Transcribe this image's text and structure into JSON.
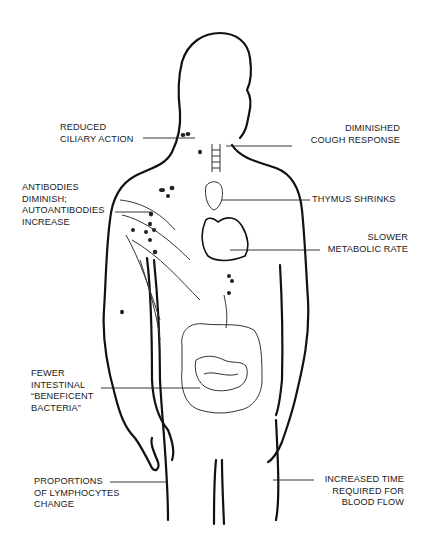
{
  "figure": {
    "line_color": "#111111",
    "background": "#ffffff"
  },
  "labels": {
    "reduced_ciliary": "REDUCED\nCILIARY ACTION",
    "cough": "DIMINISHED\nCOUGH RESPONSE",
    "antibodies": "ANTIBODIES\nDIMINISH;\nAUTOANTIBODIES\nINCREASE",
    "thymus": "THYMUS SHRINKS",
    "metabolic": "SLOWER\nMETABOLIC RATE",
    "intestinal": "FEWER\nINTESTINAL\n“BENEFICENT\nBACTERIA”",
    "lymphocytes": "PROPORTIONS\nOF LYMPHOCYTES\nCHANGE",
    "blood_flow": "INCREASED TIME\nREQUIRED FOR\nBLOOD FLOW"
  }
}
